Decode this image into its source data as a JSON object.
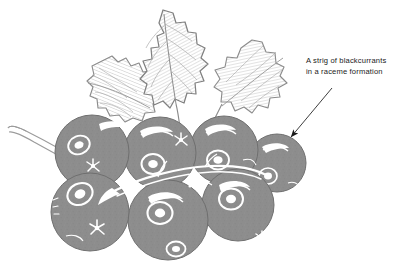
{
  "figure": {
    "name": "blackcurrant-strig-illustration",
    "subject": "blackcurrants",
    "style": "pen-and-ink hatched botanical drawing",
    "background_color": "#ffffff"
  },
  "annotation": {
    "line1": "A strig of blackcurrants",
    "line2": "in a raceme formation",
    "text": "A strig of blackcurrants\nin a raceme formation",
    "text_color": "#1b1b1b",
    "font_size_px": 7.6,
    "leader": {
      "from_x": 332,
      "from_y": 88,
      "to_x": 289,
      "to_y": 139,
      "color": "#1b1b1b",
      "arrowhead": "filled-triangle"
    }
  },
  "palette": {
    "berry_fill": "#8d8d8d",
    "berry_fill_dark": "#7e7e7e",
    "berry_outline": "#6f6f6f",
    "highlight": "#ffffff",
    "leaf_fill": "#ffffff",
    "leaf_outline": "#8a8a8a",
    "leaf_hatch": "#a8a8a8",
    "leaf_vein": "#9a9a9a",
    "stalk_outline": "#9b9b9b",
    "ink": "#1b1b1b"
  },
  "berries": [
    {
      "id": "berry-upper-left",
      "cx": 92,
      "cy": 152,
      "r": 37
    },
    {
      "id": "berry-upper-center",
      "cx": 160,
      "cy": 153,
      "r": 36
    },
    {
      "id": "berry-upper-right",
      "cx": 224,
      "cy": 150,
      "r": 34
    },
    {
      "id": "berry-upper-far-right",
      "cx": 277,
      "cy": 163,
      "r": 29
    },
    {
      "id": "berry-lower-left",
      "cx": 90,
      "cy": 212,
      "r": 39
    },
    {
      "id": "berry-lower-center",
      "cx": 168,
      "cy": 220,
      "r": 40
    },
    {
      "id": "berry-lower-right",
      "cx": 238,
      "cy": 205,
      "r": 36
    }
  ],
  "leaves": [
    {
      "id": "leaf-left",
      "tip_x": 104,
      "tip_y": 60,
      "orientation": "left-fan"
    },
    {
      "id": "leaf-center",
      "tip_x": 163,
      "tip_y": 10,
      "orientation": "upright"
    },
    {
      "id": "leaf-right",
      "tip_x": 252,
      "tip_y": 40,
      "orientation": "right-fan"
    }
  ],
  "stalk": {
    "id": "primary-stalk",
    "start_x": 8,
    "start_y": 130,
    "end_x": 90,
    "end_y": 172,
    "description": "curved outlined stem entering from the left edge"
  },
  "strig_stem": {
    "id": "raceme-strig",
    "description": "white raceme stem threading between the lower and right berries"
  }
}
